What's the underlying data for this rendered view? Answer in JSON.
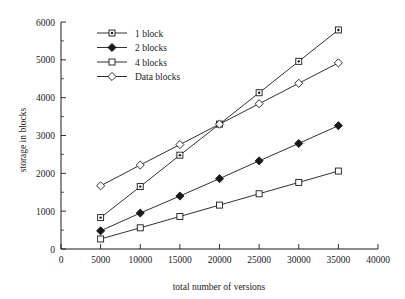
{
  "chart_data": {
    "type": "line",
    "title": "",
    "xlabel": "total number of versions",
    "ylabel": "storage in blocks",
    "xlim": [
      0,
      40000
    ],
    "ylim": [
      0,
      6000
    ],
    "grid": false,
    "legend_position": "upper-left",
    "x": [
      5000,
      10000,
      15000,
      20000,
      25000,
      30000,
      35000
    ],
    "xticks": [
      "0",
      "5000",
      "10000",
      "15000",
      "20000",
      "25000",
      "30000",
      "35000",
      "40000"
    ],
    "xtick_values": [
      0,
      5000,
      10000,
      15000,
      20000,
      25000,
      30000,
      35000,
      40000
    ],
    "yticks": [
      "0",
      "1000",
      "2000",
      "3000",
      "4000",
      "5000",
      "6000"
    ],
    "ytick_values": [
      0,
      1000,
      2000,
      3000,
      4000,
      5000,
      6000
    ],
    "yminor_values": [
      500,
      1500,
      2500,
      3500,
      4500,
      5500
    ],
    "series": [
      {
        "name": "1 block",
        "marker": "square-dotted",
        "values": [
          830,
          1650,
          2480,
          3300,
          4130,
          4960,
          5790
        ]
      },
      {
        "name": "2 blocks",
        "marker": "diamond-filled",
        "values": [
          480,
          950,
          1400,
          1860,
          2330,
          2790,
          3260
        ]
      },
      {
        "name": "4 blocks",
        "marker": "square-open",
        "values": [
          265,
          560,
          860,
          1160,
          1460,
          1760,
          2060
        ]
      },
      {
        "name": "Data blocks",
        "marker": "diamond-open",
        "values": [
          1670,
          2220,
          2760,
          3300,
          3840,
          4380,
          4920
        ]
      }
    ]
  },
  "colors": {
    "ink": "#1a1a1a",
    "background": "#ffffff"
  }
}
